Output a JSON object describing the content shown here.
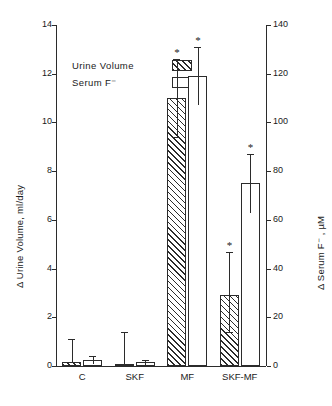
{
  "chart_data": {
    "type": "bar",
    "title": "",
    "subtitle": "",
    "categories": [
      "C",
      "SKF",
      "MF",
      "SKF-MF"
    ],
    "grid": false,
    "legend_position": "upper-left-inside",
    "xlabel": "",
    "axes": {
      "left": {
        "label": "Δ Urine Volume, ml/day",
        "ylim": [
          0,
          14
        ],
        "ticks": [
          0,
          2,
          4,
          6,
          8,
          10,
          12,
          14
        ],
        "tick_labels": [
          "0",
          "2",
          "4",
          "6",
          "8",
          "10",
          "12",
          "14"
        ],
        "units": "ml/day"
      },
      "right": {
        "label": "Δ Serum F⁻ , µM",
        "ylim": [
          0,
          140
        ],
        "ticks": [
          0,
          20,
          40,
          60,
          80,
          100,
          120,
          140
        ],
        "tick_labels": [
          "0",
          "20",
          "40",
          "60",
          "80",
          "100",
          "120",
          "140"
        ],
        "units": "µM"
      }
    },
    "series": [
      {
        "name": "Urine Volume",
        "axis": "left",
        "fill": "hatched",
        "values": [
          0.15,
          0.05,
          11.0,
          2.9
        ],
        "errors_upper": [
          0.95,
          1.35,
          1.6,
          1.8
        ],
        "errors_lower": [
          0.0,
          0.0,
          1.6,
          1.5
        ],
        "significance": [
          "",
          "",
          "*",
          "*"
        ]
      },
      {
        "name": "Serum F⁻",
        "axis": "right",
        "fill": "open",
        "values": [
          2.5,
          1.5,
          119.0,
          75.0
        ],
        "errors_upper": [
          1.5,
          1.0,
          12.0,
          12.0
        ],
        "errors_lower": [
          1.5,
          1.0,
          12.0,
          12.0
        ],
        "significance": [
          "",
          "",
          "*",
          "*"
        ]
      }
    ],
    "annotations": [
      "* denotes statistical significance"
    ]
  },
  "legend": {
    "items": [
      {
        "label": "Urine Volume",
        "swatch": "hatched"
      },
      {
        "label": "Serum F⁻",
        "swatch": "open"
      }
    ]
  },
  "ticks": {
    "left": [
      "14",
      "12",
      "10",
      "8",
      "6",
      "4",
      "2",
      "0"
    ],
    "right": [
      "140",
      "120",
      "100",
      "80",
      "60",
      "40",
      "20",
      "0"
    ]
  },
  "labels": {
    "left_axis_title": "Δ Urine Volume, ml/day",
    "right_axis_title": "Δ Serum F⁻ , µM",
    "cat_0": "C",
    "cat_1": "SKF",
    "cat_2": "MF",
    "cat_3": "SKF-MF",
    "star": "*"
  }
}
